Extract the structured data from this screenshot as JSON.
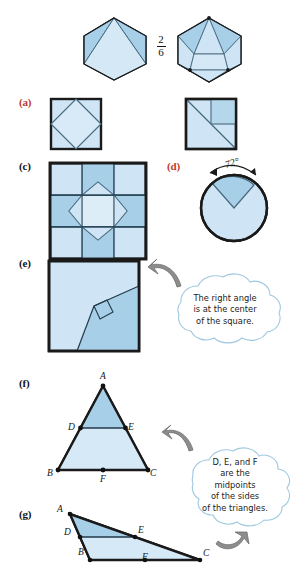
{
  "page": {
    "width": 303,
    "height": 571,
    "background": "#ffffff"
  },
  "colors": {
    "fill_light": "#cfe5f5",
    "fill_mid": "#a8cfe8",
    "fill_dark": "#8fc1e0",
    "outline_dark": "#1a1a1a",
    "outline_thin": "#4a6b80",
    "label_red": "#c0392b",
    "label_black": "#141414",
    "arrow_gray": "#8d8d8d",
    "cloud_outline": "#9ec8e0"
  },
  "hexagons": {
    "fraction": {
      "numerator": "2",
      "denominator": "6"
    },
    "left": {
      "name": "hexagon-thirds",
      "regions": 3
    },
    "right": {
      "name": "hexagon-sixths",
      "regions": 6
    }
  },
  "items": [
    {
      "id": "a",
      "letter": "(a)",
      "color": "red",
      "shape": "square-inscribed-diamond"
    },
    {
      "id": "b",
      "letter": "(b)",
      "color": "black",
      "shape": "square-diagonal-quarters"
    },
    {
      "id": "c",
      "letter": "(c)",
      "color": "black",
      "shape": "square-quilt-star"
    },
    {
      "id": "d",
      "letter": "(d)",
      "color": "red",
      "shape": "circle-sector"
    },
    {
      "id": "e",
      "letter": "(e)",
      "color": "black",
      "shape": "square-right-angle-center"
    },
    {
      "id": "f",
      "letter": "(f)",
      "color": "black",
      "shape": "triangle-acute-midsegment"
    },
    {
      "id": "g",
      "letter": "(g)",
      "color": "black",
      "shape": "triangle-obtuse-midsegment"
    }
  ],
  "angle_annotation": {
    "value": "72°",
    "name": "rotation-angle-label"
  },
  "callouts": [
    {
      "id": "callout-right-angle",
      "text": "The right angle\nis at the center\nof the square."
    },
    {
      "id": "callout-midpoints",
      "text": "D, E, and F\nare the\nmidpoints\nof the sides\nof the triangles."
    }
  ],
  "triangle_f": {
    "vertices": [
      {
        "name": "A",
        "label": "A"
      },
      {
        "name": "B",
        "label": "B"
      },
      {
        "name": "C",
        "label": "C"
      }
    ],
    "midpoints": [
      {
        "name": "D",
        "label": "D"
      },
      {
        "name": "E",
        "label": "E"
      },
      {
        "name": "F",
        "label": "F"
      }
    ]
  },
  "triangle_g": {
    "vertices": [
      {
        "name": "A",
        "label": "A"
      },
      {
        "name": "B",
        "label": "B"
      },
      {
        "name": "C",
        "label": "C"
      }
    ],
    "midpoints": [
      {
        "name": "D",
        "label": "D"
      },
      {
        "name": "E",
        "label": "E"
      },
      {
        "name": "F",
        "label": "F"
      }
    ]
  }
}
